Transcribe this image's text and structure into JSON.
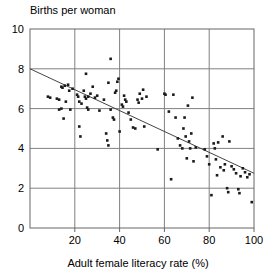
{
  "chart_data": {
    "type": "scatter",
    "title": "Births per woman",
    "xlabel": "Adult female literacy rate (%)",
    "ylabel": "Births per woman",
    "xlim": [
      0,
      100
    ],
    "ylim": [
      0,
      10
    ],
    "xticks": [
      20,
      40,
      60,
      80,
      100
    ],
    "yticks": [
      0,
      2,
      4,
      6,
      8,
      10
    ],
    "grid": true,
    "legend": "none",
    "trendline": {
      "type": "line",
      "x": [
        0,
        100
      ],
      "y": [
        8.0,
        2.75
      ],
      "label": "least-squares regression line"
    },
    "points": [
      [
        8,
        6.6
      ],
      [
        9,
        6.55
      ],
      [
        12,
        6.5
      ],
      [
        13,
        6.45
      ],
      [
        13,
        5.95
      ],
      [
        14,
        7.1
      ],
      [
        14,
        6.0
      ],
      [
        14.5,
        7.05
      ],
      [
        15,
        5.5
      ],
      [
        15.5,
        7.15
      ],
      [
        16,
        6.35
      ],
      [
        17,
        7.2
      ],
      [
        17.5,
        6.9
      ],
      [
        18,
        5.95
      ],
      [
        19,
        7.0
      ],
      [
        21,
        6.7
      ],
      [
        21.5,
        6.6
      ],
      [
        22,
        6.35
      ],
      [
        22,
        5.1
      ],
      [
        22.5,
        4.6
      ],
      [
        23,
        6.25
      ],
      [
        24,
        6.9
      ],
      [
        24.5,
        6.6
      ],
      [
        25,
        7.75
      ],
      [
        25,
        6.5
      ],
      [
        25.5,
        6.05
      ],
      [
        26,
        6.6
      ],
      [
        26,
        5.95
      ],
      [
        27,
        6.75
      ],
      [
        28,
        7.1
      ],
      [
        29,
        6.55
      ],
      [
        30,
        6.65
      ],
      [
        31,
        5.9
      ],
      [
        33,
        6.45
      ],
      [
        34,
        4.75
      ],
      [
        34.5,
        4.4
      ],
      [
        35,
        4.15
      ],
      [
        35,
        7.3
      ],
      [
        36,
        8.5
      ],
      [
        36,
        5.95
      ],
      [
        37,
        5.55
      ],
      [
        37.5,
        5.45
      ],
      [
        38,
        6.8
      ],
      [
        38.5,
        6.9
      ],
      [
        39,
        7.35
      ],
      [
        39.5,
        7.5
      ],
      [
        40,
        4.85
      ],
      [
        41,
        6.2
      ],
      [
        41.5,
        6.1
      ],
      [
        42,
        6.65
      ],
      [
        42.5,
        6.45
      ],
      [
        43,
        6.35
      ],
      [
        44,
        5.8
      ],
      [
        45,
        5.45
      ],
      [
        46,
        5.05
      ],
      [
        47,
        5.0
      ],
      [
        48,
        6.45
      ],
      [
        48.5,
        6.3
      ],
      [
        49,
        6.75
      ],
      [
        50,
        6.5
      ],
      [
        50.5,
        6.95
      ],
      [
        51,
        5.1
      ],
      [
        52,
        6.6
      ],
      [
        57,
        3.95
      ],
      [
        60,
        6.75
      ],
      [
        60.5,
        6.7
      ],
      [
        62,
        5.85
      ],
      [
        63,
        2.45
      ],
      [
        64,
        6.7
      ],
      [
        65,
        5.55
      ],
      [
        66,
        4.5
      ],
      [
        67,
        4.15
      ],
      [
        68,
        4.0
      ],
      [
        68.5,
        5.0
      ],
      [
        69,
        5.55
      ],
      [
        69.5,
        4.6
      ],
      [
        70,
        3.5
      ],
      [
        70.5,
        6.15
      ],
      [
        71,
        4.35
      ],
      [
        71.5,
        4.0
      ],
      [
        72,
        4.75
      ],
      [
        72.5,
        6.55
      ],
      [
        73,
        3.35
      ],
      [
        74,
        4.05
      ],
      [
        78,
        3.95
      ],
      [
        79,
        3.6
      ],
      [
        80,
        3.2
      ],
      [
        81,
        1.65
      ],
      [
        82,
        4.25
      ],
      [
        82.5,
        4.0
      ],
      [
        83,
        3.45
      ],
      [
        83.5,
        2.65
      ],
      [
        84,
        4.3
      ],
      [
        85,
        3.05
      ],
      [
        86,
        4.6
      ],
      [
        86.5,
        2.9
      ],
      [
        87,
        3.2
      ],
      [
        88,
        2.0
      ],
      [
        88.5,
        1.8
      ],
      [
        89,
        4.35
      ],
      [
        90,
        3.1
      ],
      [
        91,
        2.95
      ],
      [
        92,
        2.75
      ],
      [
        93,
        1.95
      ],
      [
        93.5,
        1.75
      ],
      [
        94,
        2.6
      ],
      [
        95,
        3.0
      ],
      [
        96,
        2.8
      ],
      [
        97,
        2.55
      ],
      [
        98,
        2.7
      ],
      [
        99,
        1.3
      ]
    ]
  },
  "axis": {
    "y_tick_labels": [
      "0",
      "2",
      "4",
      "6",
      "8",
      "10"
    ],
    "x_tick_labels": [
      "20",
      "40",
      "60",
      "80",
      "100"
    ]
  },
  "style": {
    "point_color": "#1a1a1a",
    "grid_color": "#808080",
    "axis_color": "#666666",
    "line_color": "#444444",
    "background": "#ffffff"
  }
}
